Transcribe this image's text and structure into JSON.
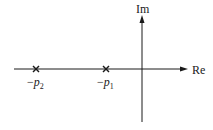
{
  "diagram": {
    "type": "s-plane pole plot",
    "axes": {
      "horizontal_label": "Re",
      "vertical_label": "Im"
    },
    "poles": [
      {
        "label_sign": "−",
        "label_var": "p",
        "label_sub": "2",
        "marker": "x"
      },
      {
        "label_sign": "−",
        "label_var": "p",
        "label_sub": "1",
        "marker": "x"
      }
    ],
    "colors": {
      "line": "#1a1a1a",
      "background": "#ffffff"
    }
  }
}
